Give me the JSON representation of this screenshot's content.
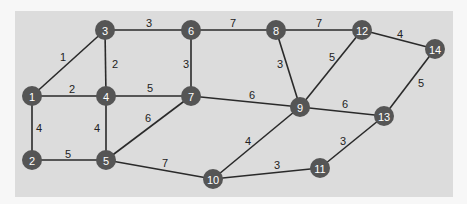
{
  "diagram": {
    "type": "weighted-undirected-graph",
    "panel_color": "#dcdcdc",
    "node_color": "#555555",
    "edge_color": "#2a2a2a",
    "nodes": [
      {
        "id": "1",
        "x": 32,
        "y": 96
      },
      {
        "id": "2",
        "x": 32,
        "y": 160
      },
      {
        "id": "3",
        "x": 105,
        "y": 30
      },
      {
        "id": "4",
        "x": 106,
        "y": 96
      },
      {
        "id": "5",
        "x": 106,
        "y": 160
      },
      {
        "id": "6",
        "x": 191,
        "y": 30
      },
      {
        "id": "7",
        "x": 191,
        "y": 96
      },
      {
        "id": "8",
        "x": 276,
        "y": 30
      },
      {
        "id": "9",
        "x": 300,
        "y": 107
      },
      {
        "id": "10",
        "x": 213,
        "y": 179
      },
      {
        "id": "11",
        "x": 320,
        "y": 168
      },
      {
        "id": "12",
        "x": 362,
        "y": 30
      },
      {
        "id": "13",
        "x": 384,
        "y": 116
      },
      {
        "id": "14",
        "x": 435,
        "y": 49
      }
    ],
    "edges": [
      {
        "from": "1",
        "to": "3",
        "weight": "1",
        "lx": 63,
        "ly": 57
      },
      {
        "from": "1",
        "to": "4",
        "weight": "2",
        "lx": 72,
        "ly": 89
      },
      {
        "from": "1",
        "to": "2",
        "weight": "4",
        "lx": 39,
        "ly": 128
      },
      {
        "from": "2",
        "to": "5",
        "weight": "5",
        "lx": 68,
        "ly": 154
      },
      {
        "from": "3",
        "to": "6",
        "weight": "3",
        "lx": 149,
        "ly": 23
      },
      {
        "from": "3",
        "to": "4",
        "weight": "2",
        "lx": 115,
        "ly": 64
      },
      {
        "from": "4",
        "to": "7",
        "weight": "5",
        "lx": 150,
        "ly": 88
      },
      {
        "from": "4",
        "to": "5",
        "weight": "4",
        "lx": 97,
        "ly": 128
      },
      {
        "from": "5",
        "to": "7",
        "weight": "6",
        "lx": 148,
        "ly": 118
      },
      {
        "from": "5",
        "to": "10",
        "weight": "7",
        "lx": 165,
        "ly": 163
      },
      {
        "from": "6",
        "to": "7",
        "weight": "3",
        "lx": 186,
        "ly": 64
      },
      {
        "from": "6",
        "to": "8",
        "weight": "7",
        "lx": 233,
        "ly": 23
      },
      {
        "from": "7",
        "to": "9",
        "weight": "6",
        "lx": 252,
        "ly": 95
      },
      {
        "from": "8",
        "to": "12",
        "weight": "7",
        "lx": 319,
        "ly": 23
      },
      {
        "from": "8",
        "to": "9",
        "weight": "3",
        "lx": 280,
        "ly": 64
      },
      {
        "from": "9",
        "to": "12",
        "weight": "5",
        "lx": 332,
        "ly": 57
      },
      {
        "from": "9",
        "to": "13",
        "weight": "6",
        "lx": 345,
        "ly": 104
      },
      {
        "from": "9",
        "to": "10",
        "weight": "4",
        "lx": 248,
        "ly": 141
      },
      {
        "from": "10",
        "to": "11",
        "weight": "3",
        "lx": 277,
        "ly": 165
      },
      {
        "from": "11",
        "to": "13",
        "weight": "3",
        "lx": 343,
        "ly": 141
      },
      {
        "from": "12",
        "to": "14",
        "weight": "4",
        "lx": 400,
        "ly": 34
      },
      {
        "from": "13",
        "to": "14",
        "weight": "5",
        "lx": 421,
        "ly": 83
      }
    ]
  }
}
